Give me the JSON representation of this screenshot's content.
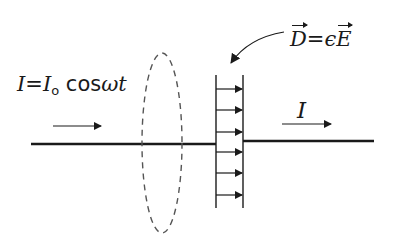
{
  "diagram": {
    "labels": {
      "current_eq_lhs": "I",
      "current_eq_eq": "=",
      "current_eq_I": "I",
      "current_eq_sub": "o",
      "current_eq_rhs": " cos",
      "current_eq_omega": "ωt",
      "d_field_D": "D",
      "d_field_eq": "=",
      "d_field_eps": "ϵ",
      "d_field_E": "E",
      "current_right": "I"
    },
    "elements": {
      "wire": "horizontal conductor",
      "amperian_loop": "dashed ellipse",
      "capacitor_plates": 2,
      "field_arrows": 6,
      "current_arrows": 2,
      "pointer_arrow": "curved arrow from D label to plates"
    },
    "colors": {
      "line": "#1a1a1a",
      "dashed_loop": "#555555",
      "background": "#ffffff"
    }
  }
}
